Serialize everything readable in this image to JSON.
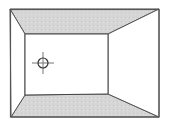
{
  "diagram": {
    "type": "room-perspective",
    "colors": {
      "background": "#ffffff",
      "stroke": "#555555",
      "shaded_surface": "#d6d6d6",
      "wall_fill": "#ffffff"
    },
    "outer_rect": {
      "tl": [
        10,
        9
      ],
      "tr": [
        159,
        9
      ],
      "br": [
        159,
        117
      ],
      "bl": [
        11,
        117
      ]
    },
    "inner_rect": {
      "tl": [
        25,
        34
      ],
      "tr": [
        108,
        34
      ],
      "br": [
        108,
        94
      ],
      "bl": [
        25,
        95
      ]
    },
    "surfaces": [
      {
        "name": "ceiling",
        "shaded": true
      },
      {
        "name": "floor",
        "shaded": true
      },
      {
        "name": "left-wall",
        "shaded": false
      },
      {
        "name": "right-wall",
        "shaded": false
      },
      {
        "name": "back-wall",
        "shaded": false
      }
    ],
    "marker": {
      "name": "crosshair",
      "center": [
        43,
        63
      ],
      "radius": 5,
      "arm": 11
    }
  }
}
